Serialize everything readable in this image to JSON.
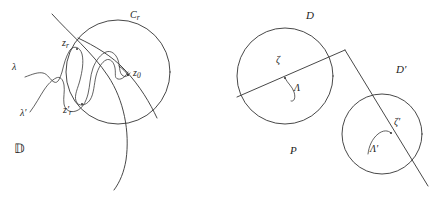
{
  "figure": {
    "background_color": "#ffffff",
    "stroke_color": "#333333",
    "panels": [
      {
        "name": "left-panel",
        "domain_label": "D",
        "labels": [
          "C_r",
          "z_r",
          "z_0",
          "lambda",
          "lambda-prime",
          "z_r-prime",
          "blackboard-D"
        ]
      },
      {
        "name": "right-panel",
        "domain_label": "P",
        "labels": [
          "D",
          "D'",
          "zeta",
          "zeta-prime",
          "Lambda",
          "Lambda-prime",
          "P"
        ]
      }
    ]
  },
  "left": {
    "circle_label": "C",
    "circle_label_sub": "r",
    "point_zr": "z",
    "point_zr_sub": "r",
    "point_z0": "z",
    "point_z0_sub": "0",
    "curve_lambda": "λ",
    "curve_lambda_prime": "λ′",
    "point_zr_prime": "z",
    "point_zr_prime_sub": "r",
    "point_zr_prime_mark": "′",
    "domain_symbol": "𝔻"
  },
  "right": {
    "disk_D": "D",
    "disk_D_prime": "D′",
    "point_zeta": "ζ",
    "point_zeta_prime": "ζ′",
    "arc_Lambda": "Λ",
    "arc_Lambda_prime": "Λ′",
    "plane_symbol": "P"
  }
}
